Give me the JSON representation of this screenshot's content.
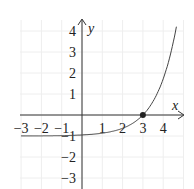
{
  "chart_data": {
    "type": "line",
    "title": "",
    "function": "y = e^(x-3) - 1",
    "xlabel": "x",
    "ylabel": "y",
    "xlim": [
      -3.1,
      5
    ],
    "ylim": [
      -3.5,
      4.5
    ],
    "x_ticks": [
      -3,
      -2,
      -1,
      1,
      2,
      3,
      4
    ],
    "x_tick_labels": [
      "−3",
      "−2",
      "−1",
      "1",
      "2",
      "3",
      "4"
    ],
    "y_ticks": [
      -3,
      -2,
      -1,
      1,
      2,
      3,
      4
    ],
    "y_tick_labels": [
      "−3",
      "−2",
      "−1",
      "1",
      "2",
      "3",
      "4"
    ],
    "grid": true,
    "series": [
      {
        "name": "curve",
        "x": [
          -3,
          -2,
          -1,
          0,
          1,
          2,
          2.5,
          3,
          3.5,
          4,
          4.3,
          4.68
        ],
        "y": [
          -0.998,
          -0.993,
          -0.982,
          -0.95,
          -0.865,
          -0.632,
          -0.393,
          0,
          0.649,
          1.718,
          2.669,
          4.366
        ]
      }
    ],
    "annotations": [
      {
        "type": "point",
        "x": 3,
        "y": 0,
        "label": ""
      }
    ],
    "asymptote": {
      "y": -1
    }
  }
}
